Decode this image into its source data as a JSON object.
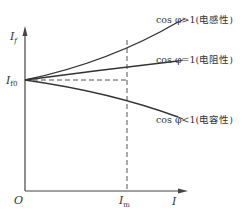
{
  "diagram": {
    "type": "characteristic-curve",
    "y_axis": {
      "label": "I",
      "label_sub": "f"
    },
    "x_axis": {
      "label": "I"
    },
    "origin_label": "O",
    "y_marker": {
      "label": "I",
      "label_sub": "f0"
    },
    "x_marker": {
      "label": "I",
      "label_sub": "m"
    },
    "curves": [
      {
        "id": "inductive",
        "label": "cos φ>1(电感性)",
        "trend": "rising"
      },
      {
        "id": "resistive",
        "label": "cos φ=1(电阻性)",
        "trend": "slightly-rising"
      },
      {
        "id": "capacitive",
        "label": "cos φ<1(电容性)",
        "trend": "falling"
      }
    ],
    "colors": {
      "line": "#333333",
      "background": "#ffffff"
    }
  }
}
